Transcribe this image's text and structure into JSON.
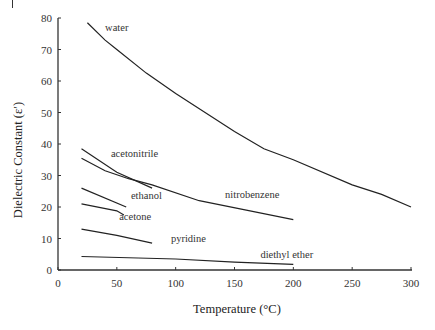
{
  "chart_data": {
    "type": "line",
    "title": "",
    "xlabel": "Temperature (°C)",
    "ylabel": "Dielectric Constant (ε′)",
    "xlim": [
      0,
      300
    ],
    "ylim": [
      0,
      80
    ],
    "xticks": [
      0,
      50,
      100,
      150,
      200,
      250,
      300
    ],
    "yticks": [
      0,
      10,
      20,
      30,
      40,
      50,
      60,
      70,
      80
    ],
    "grid": false,
    "legend": "none (inline labels)",
    "series": [
      {
        "name": "water",
        "label_at": [
          40,
          76
        ],
        "x": [
          25,
          40,
          50,
          75,
          100,
          125,
          150,
          175,
          200,
          250,
          275,
          300
        ],
        "y": [
          78.5,
          73,
          70,
          62.5,
          56,
          50,
          44,
          38.5,
          35,
          27,
          24,
          20
        ]
      },
      {
        "name": "acetonitrile",
        "label_at": [
          45,
          36
        ],
        "x": [
          20,
          50,
          80
        ],
        "y": [
          38.5,
          31,
          26
        ]
      },
      {
        "name": "nitrobenzene",
        "label_at": [
          142,
          23
        ],
        "x": [
          20,
          40,
          60,
          80,
          120,
          160,
          200
        ],
        "y": [
          35.5,
          31.5,
          29,
          27,
          22,
          19,
          16
        ]
      },
      {
        "name": "ethanol",
        "label_at": [
          62,
          22.5
        ],
        "x": [
          20,
          58
        ],
        "y": [
          26,
          20
        ]
      },
      {
        "name": "acetone",
        "label_at": [
          52,
          16
        ],
        "x": [
          20,
          50,
          56
        ],
        "y": [
          21,
          18.8,
          17.5
        ]
      },
      {
        "name": "pyridine",
        "label_at": [
          96,
          9
        ],
        "x": [
          20,
          50,
          80
        ],
        "y": [
          13,
          11,
          8.5
        ]
      },
      {
        "name": "diethyl ether",
        "label_at": [
          172,
          3.8
        ],
        "x": [
          20,
          100,
          150,
          200
        ],
        "y": [
          4.3,
          3.5,
          2.5,
          1.8
        ]
      }
    ]
  }
}
